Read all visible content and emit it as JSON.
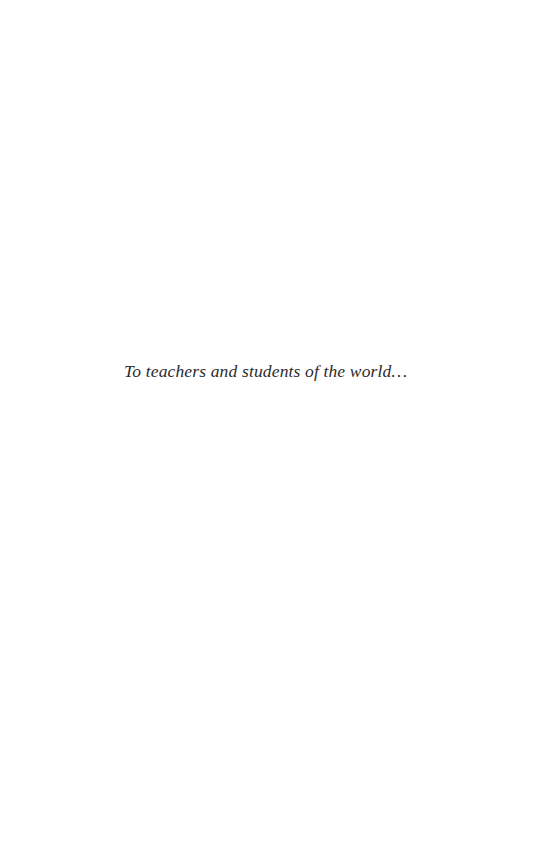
{
  "page": {
    "dedication": "To teachers and students of the world…"
  },
  "colors": {
    "background": "#ffffff",
    "text": "#2b2b2b"
  }
}
